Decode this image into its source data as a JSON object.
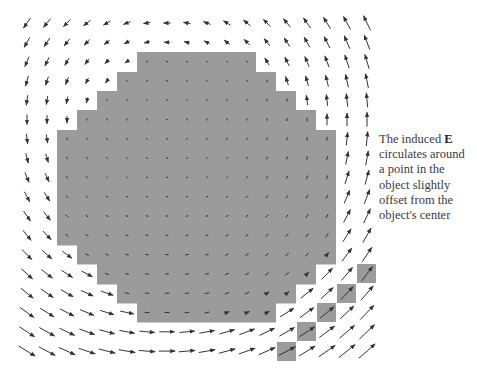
{
  "figure": {
    "width": 477,
    "height": 376,
    "background": "#ffffff",
    "object_color": "#9b9b9b",
    "arrow_color": "#333333"
  },
  "grid": {
    "cols": 18,
    "rows": 18,
    "x0": 27,
    "y0": 23,
    "dx": 20,
    "dy": 19.3
  },
  "object": {
    "description": "Pixelated roughly circular conducting object (gray cells) with a diagonal chain of five gray cells extending toward the lower right",
    "row_spans": [
      {
        "y_top": 52,
        "y_bottom": 72,
        "x_left": 137,
        "x_right": 256
      },
      {
        "y_top": 72,
        "y_bottom": 91,
        "x_left": 117,
        "x_right": 276
      },
      {
        "y_top": 91,
        "y_bottom": 110,
        "x_left": 97,
        "x_right": 296
      },
      {
        "y_top": 110,
        "y_bottom": 130,
        "x_left": 77,
        "x_right": 316
      },
      {
        "y_top": 130,
        "y_bottom": 245,
        "x_left": 57,
        "x_right": 336
      },
      {
        "y_top": 245,
        "y_bottom": 264,
        "x_left": 77,
        "x_right": 336
      },
      {
        "y_top": 264,
        "y_bottom": 284,
        "x_left": 97,
        "x_right": 316
      },
      {
        "y_top": 284,
        "y_bottom": 303,
        "x_left": 117,
        "x_right": 296
      },
      {
        "y_top": 303,
        "y_bottom": 322,
        "x_left": 137,
        "x_right": 276
      }
    ],
    "extra_cells": [
      {
        "x": 357,
        "y": 264,
        "w": 19,
        "h": 19
      },
      {
        "x": 337,
        "y": 284,
        "w": 19,
        "h": 19
      },
      {
        "x": 317,
        "y": 303,
        "w": 19,
        "h": 19
      },
      {
        "x": 297,
        "y": 322,
        "w": 19,
        "h": 19
      },
      {
        "x": 277,
        "y": 342,
        "w": 19,
        "h": 19
      }
    ]
  },
  "field_model": {
    "type": "circulation",
    "center": {
      "x": 205,
      "y": 205
    },
    "uniform": {
      "ex": 0.55,
      "ey": -0.25
    },
    "swirl": 0.0065,
    "inside_scale": 0.35,
    "max_len": 22,
    "min_len": 2
  },
  "caption": {
    "line1_pre": "The induced ",
    "line1_bold": "E",
    "line2": "circulates around",
    "line3": "a point in the",
    "line4": "object slightly",
    "line5": "offset from the",
    "line6": "object's center"
  }
}
